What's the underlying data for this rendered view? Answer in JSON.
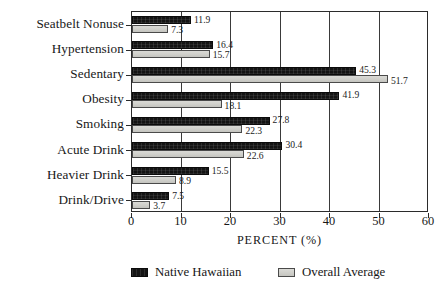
{
  "chart_data": {
    "type": "bar",
    "orientation": "horizontal",
    "title": "",
    "xlabel": "PERCENT (%)",
    "ylabel": "",
    "xlim": [
      0,
      60
    ],
    "xticks": [
      0,
      10,
      20,
      30,
      40,
      50,
      60
    ],
    "grid": true,
    "legend_position": "bottom",
    "categories": [
      "Seatbelt Nonuse",
      "Hypertension",
      "Sedentary",
      "Obesity",
      "Smoking",
      "Acute Drink",
      "Heavier Drink",
      "Drink/Drive"
    ],
    "series": [
      {
        "name": "Native Hawaiian",
        "color": "#141414",
        "values": [
          11.9,
          16.4,
          45.3,
          41.9,
          27.8,
          30.4,
          15.5,
          7.5
        ]
      },
      {
        "name": "Overall Average",
        "color": "#d2d2ce",
        "values": [
          7.3,
          15.7,
          51.7,
          18.1,
          22.3,
          22.6,
          8.9,
          3.7
        ]
      }
    ]
  }
}
